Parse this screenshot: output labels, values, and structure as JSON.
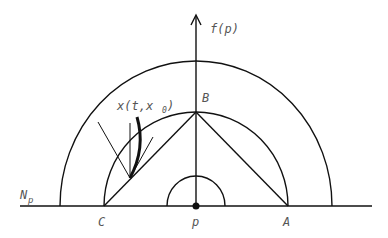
{
  "diagram": {
    "labels": {
      "axis": "f(p)",
      "B": "B",
      "C": "C",
      "A": "A",
      "p": "p",
      "manifold": "N",
      "manifold_sub": "p",
      "trajectory": "x(t,x",
      "trajectory_sub": "0",
      "trajectory_close": ")"
    },
    "colors": {
      "line": "#111111",
      "text": "#555555",
      "background": "#ffffff"
    }
  }
}
